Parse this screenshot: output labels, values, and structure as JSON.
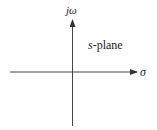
{
  "diagram": {
    "labels": {
      "vertical_axis": "jω",
      "horizontal_axis": "σ",
      "plane_var": "s",
      "plane_suffix": "-plane"
    },
    "colors": {
      "axis": "#444444",
      "text": "#222222",
      "background": "#ffffff"
    }
  }
}
